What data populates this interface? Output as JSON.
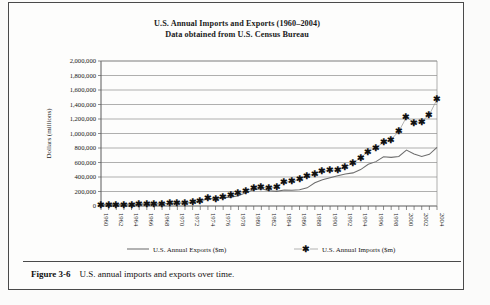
{
  "figure": {
    "number_label": "Figure 3-6",
    "caption": "U.S. annual imports and exports over time."
  },
  "chart_data": {
    "type": "line",
    "title": "U.S. Annual Imports and Exports (1960–2004)",
    "subtitle": "Data obtained from U.S. Census Bureau",
    "title_lines": [
      "U.S. Annual Imports and Exports (1960–2004)",
      "Data obtained from U.S. Census Bureau"
    ],
    "xlabel": "",
    "ylabel": "Dollars (millions)",
    "ylim": [
      0,
      2000000
    ],
    "ytick_step": 200000,
    "grid": true,
    "legend_position": "bottom",
    "ytick_labels": [
      "0",
      "200,000",
      "400,000",
      "600,000",
      "800,000",
      "1,000,000",
      "1,200,000",
      "1,400,000",
      "1,600,000",
      "1,800,000",
      "2,000,000"
    ],
    "ytick_values": [
      0,
      200000,
      400000,
      600000,
      800000,
      1000000,
      1200000,
      1400000,
      1600000,
      1800000,
      2000000
    ],
    "x": [
      1960,
      1961,
      1962,
      1963,
      1964,
      1965,
      1966,
      1967,
      1968,
      1969,
      1970,
      1971,
      1972,
      1973,
      1974,
      1975,
      1976,
      1977,
      1978,
      1979,
      1980,
      1981,
      1982,
      1983,
      1984,
      1985,
      1986,
      1987,
      1988,
      1989,
      1990,
      1991,
      1992,
      1993,
      1994,
      1995,
      1996,
      1997,
      1998,
      1999,
      2000,
      2001,
      2002,
      2003,
      2004
    ],
    "xtick_labels": [
      "1960",
      "1962",
      "1964",
      "1966",
      "1968",
      "1970",
      "1972",
      "1974",
      "1976",
      "1978",
      "1980",
      "1982",
      "1984",
      "1986",
      "1988",
      "1990",
      "1992",
      "1994",
      "1996",
      "1998",
      "2000",
      "2002",
      "2004"
    ],
    "xtick_values": [
      1960,
      1962,
      1964,
      1966,
      1968,
      1970,
      1972,
      1974,
      1976,
      1978,
      1980,
      1982,
      1984,
      1986,
      1988,
      1990,
      1992,
      1994,
      1996,
      1998,
      2000,
      2002,
      2004
    ],
    "series": [
      {
        "name": "U.S. Annual Exports ($m)",
        "style": "solid-line",
        "marker": "none",
        "color": "#6e6e6e",
        "values": [
          19650,
          20108,
          20781,
          22272,
          25501,
          26461,
          29310,
          30666,
          33626,
          36414,
          42469,
          43319,
          49381,
          71410,
          98306,
          107088,
          114745,
          120816,
          142075,
          184439,
          224250,
          237044,
          211157,
          201799,
          219926,
          215915,
          223344,
          250208,
          320230,
          362120,
          389307,
          416913,
          440352,
          456832,
          502398,
          575204,
          612113,
          678366,
          670416,
          683965,
          771994,
          718712,
          681874,
          713122,
          807536
        ]
      },
      {
        "name": "U.S. Annual Imports ($m)",
        "style": "marker-line",
        "marker": "asterisk",
        "color": "#9a9a9a",
        "values": [
          14758,
          14537,
          16260,
          17048,
          18700,
          21510,
          25493,
          26866,
          32991,
          35807,
          39866,
          45579,
          55797,
          70499,
          103811,
          98185,
          124228,
          151907,
          176002,
          212009,
          249750,
          265067,
          247642,
          268901,
          332418,
          338088,
          368425,
          409765,
          447189,
          477365,
          498338,
          490981,
          536458,
          589394,
          668690,
          749374,
          803113,
          876485,
          917103,
          1029987,
          1224417,
          1145927,
          1164746,
          1260717,
          1469704
        ]
      }
    ]
  },
  "legend": {
    "entries": [
      {
        "label": "U.S. Annual Exports ($m)",
        "symbol": "line"
      },
      {
        "label": "U.S. Annual Imports ($m)",
        "symbol": "asterisk"
      }
    ]
  }
}
